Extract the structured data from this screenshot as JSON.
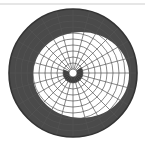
{
  "diagram": {
    "type": "polar-grid-with-shaded-region",
    "center": [
      73,
      73
    ],
    "outer_radius": 64,
    "hole_radius": 4,
    "ring_count": 10,
    "spoke_count": 24,
    "colors": {
      "background": "#ffffff",
      "shade": "#4a4a4a",
      "grid_on_white": "#555555",
      "grid_on_shade": "#1a1a1a",
      "outline": "#333333",
      "top_line": "#e6e6e6"
    },
    "white_region": {
      "cx": 81,
      "cy": 75,
      "rx": 48,
      "ry": 43
    },
    "inner_shade": {
      "r_inner": 4,
      "r_outer": 10,
      "start_deg": 160,
      "end_deg": 395
    }
  }
}
